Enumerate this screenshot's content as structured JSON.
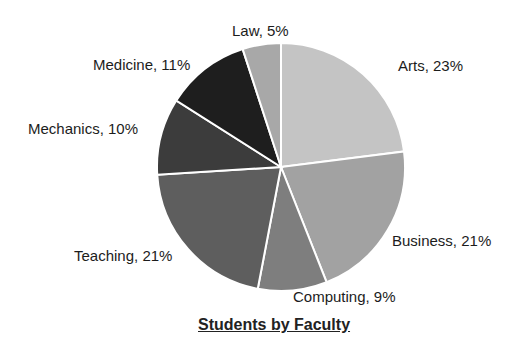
{
  "chart_data": {
    "type": "pie",
    "title": "Students by Faculty",
    "categories": [
      "Arts",
      "Business",
      "Computing",
      "Teaching",
      "Mechanics",
      "Medicine",
      "Law"
    ],
    "values": [
      23,
      21,
      9,
      21,
      10,
      11,
      5
    ],
    "unit": "%",
    "colors": [
      "#c4c4c4",
      "#a2a2a2",
      "#7e7e7e",
      "#5e5e5e",
      "#3c3c3c",
      "#1e1e1e",
      "#a8a8a8"
    ],
    "start_angle_deg": 0,
    "direction": "clockwise",
    "legend": "none",
    "labels": [
      "Arts, 23%",
      "Business, 21%",
      "Computing, 9%",
      "Teaching, 21%",
      "Mechanics, 10%",
      "Medicine, 11%",
      "Law, 5%"
    ]
  },
  "labels": {
    "arts": "Arts, 23%",
    "business": "Business, 21%",
    "computing": "Computing, 9%",
    "teaching": "Teaching, 21%",
    "mechanics": "Mechanics, 10%",
    "medicine": "Medicine, 11%",
    "law": "Law, 5%"
  },
  "title": "Students by Faculty"
}
